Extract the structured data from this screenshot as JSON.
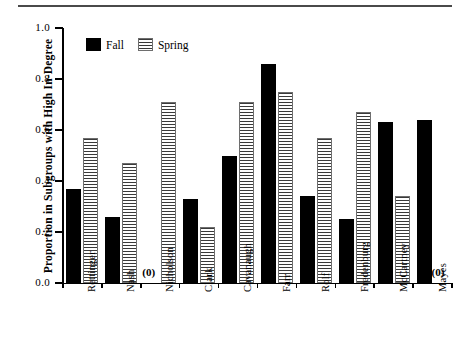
{
  "chart_data": {
    "type": "bar",
    "title": "",
    "xlabel": "",
    "ylabel": "Proportion in Subgroups with High In-Degree",
    "ylim": [
      0.0,
      1.0
    ],
    "ytick_labels": [
      "0.0",
      "0.2",
      "0.4",
      "0.6",
      "0.8",
      "1.0"
    ],
    "ytick_values": [
      0.0,
      0.2,
      0.4,
      0.6,
      0.8,
      1.0
    ],
    "grid": false,
    "legend_position": "top-left-inside",
    "categories": [
      "Rettinger",
      "Nash",
      "Nicholson",
      "Clark",
      "Cavanaugh",
      "Farr",
      "Rolf",
      "Fredenburg",
      "McCartney",
      "Mayes"
    ],
    "series": [
      {
        "name": "Fall",
        "color": "#000000",
        "fill": "solid",
        "values": [
          0.37,
          0.26,
          0.0,
          0.33,
          0.5,
          0.86,
          0.34,
          0.25,
          0.63,
          0.64
        ]
      },
      {
        "name": "Spring",
        "color": "#6e6e6e",
        "fill": "horizontal-stripes",
        "values": [
          0.57,
          0.47,
          0.71,
          0.22,
          0.71,
          0.75,
          0.57,
          0.67,
          0.34,
          0.0
        ]
      }
    ],
    "annotations": [
      {
        "text": "(0)",
        "category": "Nicholson",
        "series": "Fall",
        "value": 0.0
      },
      {
        "text": "(0)",
        "category": "Mayes",
        "series": "Spring",
        "value": 0.0
      }
    ]
  }
}
